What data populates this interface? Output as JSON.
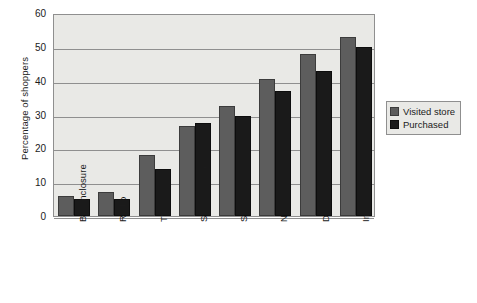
{
  "chart_data": {
    "type": "bar",
    "title": "",
    "xlabel": "",
    "ylabel": "Percentage of shoppers",
    "ylim": [
      0,
      60
    ],
    "ytick_labels": [
      "60",
      "50",
      "40",
      "30",
      "20",
      "10",
      "0"
    ],
    "yticks": [
      60,
      50,
      40,
      30,
      20,
      10,
      0
    ],
    "grid": true,
    "legend_position": "right",
    "categories": [
      "Bill enclosure",
      "Radio",
      "TV",
      "Special event",
      "Store catalog",
      "Newspaper ad",
      "DM flyer",
      "Insert"
    ],
    "category_footnotes": [
      "",
      "",
      "",
      "",
      "",
      "",
      "a",
      "b"
    ],
    "series": [
      {
        "name": "Visited store",
        "color": "#5d5d5d",
        "values": [
          6,
          7,
          18,
          26.5,
          32.5,
          40.5,
          48,
          53
        ]
      },
      {
        "name": "Purchased",
        "color": "#1a1a1a",
        "values": [
          5,
          5,
          14,
          27.5,
          29.5,
          37,
          43,
          50
        ]
      }
    ]
  },
  "plot": {
    "background_color": "#e9e9e6",
    "axis_color": "#8f8f8f"
  }
}
